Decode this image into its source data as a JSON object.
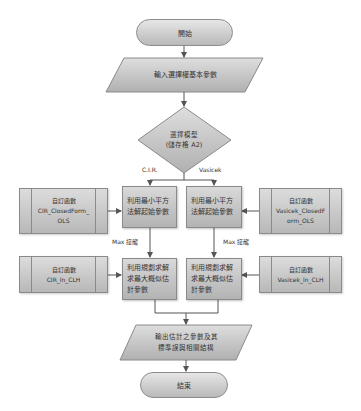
{
  "flowchart": {
    "start": {
      "label": "開始"
    },
    "input": {
      "label": "輸入選擇權基本參數"
    },
    "decision": {
      "line1": "選擇模型",
      "line2": "(儲存格 A2)"
    },
    "branches": {
      "left": "C.I.R.",
      "right": "Vasicek"
    },
    "left_column": {
      "ols_step": "利用最小平方法解起始參數",
      "max_label": "Max 接龍",
      "mle_step": "利用規劃求解求最大概似估計參數"
    },
    "right_column": {
      "ols_step": "利用最小平方法解起始參數",
      "max_label": "Max 接龍",
      "mle_step": "利用規劃求解求最大概似估計參數"
    },
    "functions": {
      "cir_ols": {
        "title": "自訂函數",
        "name_line1": "CIR_ClosedForm_",
        "name_line2": "OLS"
      },
      "vasicek_ols": {
        "title": "自訂函數",
        "name_line1": "Vasicek_ClosedF",
        "name_line2": "orm_OLS"
      },
      "cir_mle": {
        "title": "自訂函數",
        "name": "CIR_ln_CLH"
      },
      "vasicek_mle": {
        "title": "自訂函數",
        "name": "Vasicek_ln_CLH"
      }
    },
    "output": {
      "line1": "輸出估計之參數及其",
      "line2": "標準誤與相關結構"
    },
    "end": {
      "label": "結束"
    }
  },
  "colors": {
    "shape_fill_light": "#dcdcdc",
    "shape_fill_dark": "#b3b3b3",
    "stroke": "#8a8a8a",
    "connector": "#555555"
  }
}
